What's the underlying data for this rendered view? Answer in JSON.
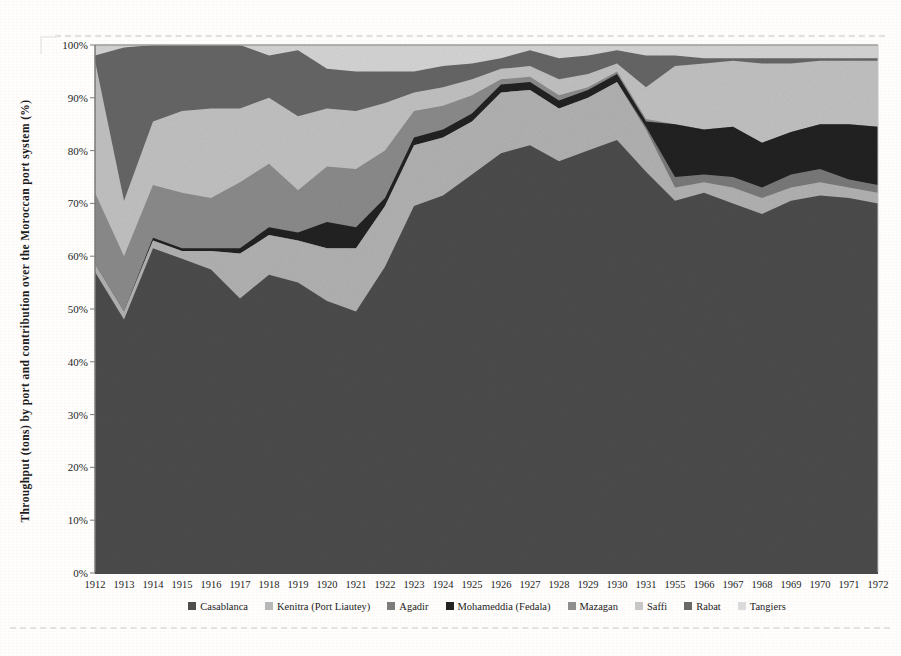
{
  "figure": {
    "y_axis_title": "Throughput  (tons) by port and contribution over the Moroccan port system  (%)",
    "y_ticks": [
      "0%",
      "10%",
      "20%",
      "30%",
      "40%",
      "50%",
      "60%",
      "70%",
      "80%",
      "90%",
      "100%"
    ]
  },
  "chart_data": {
    "type": "area",
    "stacked": true,
    "percent_stacked": true,
    "title": "",
    "xlabel": "",
    "ylabel": "Throughput  (tons) by port and contribution over the Moroccan port system  (%)",
    "ylim": [
      0,
      100
    ],
    "grid": false,
    "legend_position": "bottom",
    "x": [
      "1912",
      "1913",
      "1914",
      "1915",
      "1916",
      "1917",
      "1918",
      "1919",
      "1920",
      "1921",
      "1922",
      "1923",
      "1924",
      "1925",
      "1926",
      "1927",
      "1928",
      "1929",
      "1930",
      "1931",
      "1955",
      "1966",
      "1967",
      "1968",
      "1969",
      "1970",
      "1971",
      "1972"
    ],
    "series": [
      {
        "name": "Casablanca",
        "color": "#4e4e4e",
        "values": [
          57,
          48,
          61.5,
          59.5,
          57.5,
          52,
          56.5,
          55,
          51.5,
          49.5,
          58,
          69.5,
          71.5,
          75.5,
          79.5,
          81,
          78,
          80,
          82,
          76,
          70.5,
          72,
          70,
          68,
          70.5,
          71.5,
          71,
          70
        ]
      },
      {
        "name": "Kenitra (Port Liautey)",
        "color": "#b7b7b7",
        "values": [
          1.5,
          1.5,
          1.5,
          1.5,
          3.5,
          8.5,
          7.5,
          8,
          10,
          12,
          11.5,
          11.5,
          11,
          10,
          11.5,
          10.5,
          10,
          10,
          11,
          8,
          2.5,
          2,
          3,
          3,
          2.5,
          2.5,
          2,
          2
        ]
      },
      {
        "name": "Agadir",
        "color": "#7d7d7d",
        "values": [
          0,
          0,
          0,
          0,
          0,
          0,
          0,
          0,
          0,
          0,
          0,
          0,
          0,
          0,
          0,
          0,
          0,
          0,
          0,
          0.5,
          2,
          1.5,
          2,
          2,
          2.5,
          2.5,
          1.5,
          1.5
        ]
      },
      {
        "name": "Mohameddia (Fedala)",
        "color": "#232323",
        "values": [
          0,
          0,
          0.5,
          0.5,
          0.5,
          1,
          1.5,
          1.5,
          5,
          4,
          1.5,
          1.5,
          1.5,
          1.5,
          1.5,
          1.5,
          1.5,
          1.5,
          1.5,
          1,
          10,
          8.5,
          9.5,
          8.5,
          8,
          8.5,
          10.5,
          11
        ]
      },
      {
        "name": "Mazagan",
        "color": "#8f8f8f",
        "values": [
          13.5,
          10.5,
          10,
          10.5,
          9.5,
          12.5,
          12,
          8,
          10.5,
          11,
          9,
          5,
          4.5,
          3.5,
          1,
          1,
          1,
          0.5,
          0.5,
          0.5,
          0,
          0,
          0,
          0,
          0,
          0,
          0,
          0
        ]
      },
      {
        "name": "Saffi",
        "color": "#c7c7c7",
        "values": [
          25,
          10.5,
          12,
          15.5,
          17,
          14,
          12.5,
          14,
          11,
          11,
          9,
          3.5,
          3.5,
          3,
          2,
          2,
          3,
          2.5,
          1.5,
          6,
          11,
          12.5,
          12.5,
          15,
          13,
          12,
          12,
          12.5
        ]
      },
      {
        "name": "Rabat",
        "color": "#696969",
        "values": [
          1,
          29,
          14.5,
          12.5,
          12,
          12,
          8,
          12.5,
          7.5,
          7.5,
          6,
          4,
          4,
          3,
          2,
          3,
          4,
          3.5,
          2.5,
          6,
          2,
          1,
          0.5,
          1,
          1,
          0.5,
          0.5,
          0.5
        ]
      },
      {
        "name": "Tangiers",
        "color": "#dbdbdb",
        "values": [
          2,
          0.5,
          0,
          0,
          0,
          0,
          2,
          1,
          4.5,
          5,
          5,
          5,
          4,
          3.5,
          2.5,
          1,
          2.5,
          2,
          1,
          2,
          2,
          2.5,
          2.5,
          2.5,
          2.5,
          2.5,
          2.5,
          2.5
        ]
      }
    ]
  }
}
